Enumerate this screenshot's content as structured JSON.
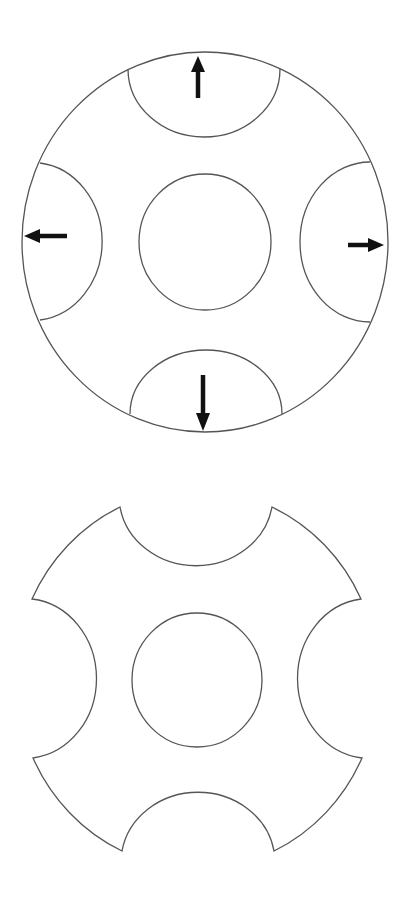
{
  "diagram": {
    "colors": {
      "line": "#555555",
      "arrow": "#111111",
      "background": "#ffffff"
    },
    "top_figure": {
      "name": "disc-with-cut-segments",
      "outer_circle": {
        "cx": 205,
        "cy": 242,
        "rx": 183,
        "ry": 190
      },
      "inner_circle": {
        "cx": 205,
        "cy": 242,
        "rx": 66,
        "ry": 68
      },
      "segments": [
        "top",
        "bottom",
        "left",
        "right"
      ],
      "arrows": [
        {
          "direction": "up",
          "icon": "arrow-up-icon"
        },
        {
          "direction": "down",
          "icon": "arrow-down-icon"
        },
        {
          "direction": "left",
          "icon": "arrow-left-icon"
        },
        {
          "direction": "right",
          "icon": "arrow-right-icon"
        }
      ]
    },
    "bottom_figure": {
      "name": "notched-disc-result",
      "inner_circle": {
        "cx": 197,
        "cy": 680,
        "rx": 65,
        "ry": 67
      },
      "notches": 4
    }
  }
}
